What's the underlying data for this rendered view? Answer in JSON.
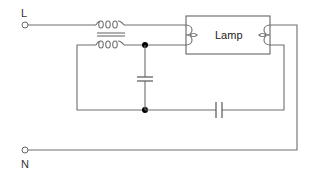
{
  "diagram": {
    "terminals": {
      "line": {
        "label": "L"
      },
      "neutral": {
        "label": "N"
      }
    },
    "lamp": {
      "label": "Lamp"
    },
    "components": [
      {
        "id": "choke-top",
        "type": "inductor"
      },
      {
        "id": "choke-bottom",
        "type": "inductor"
      },
      {
        "id": "core",
        "type": "transformer-core"
      },
      {
        "id": "cap-shunt",
        "type": "capacitor"
      },
      {
        "id": "cap-series",
        "type": "capacitor"
      }
    ],
    "colors": {
      "wire": "#6e6e6e",
      "junction": "#000000",
      "background": "#ffffff"
    }
  }
}
